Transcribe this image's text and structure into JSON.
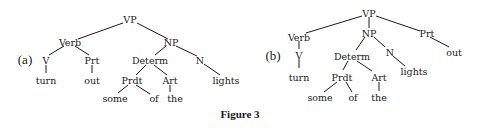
{
  "caption": "Figure 3",
  "trees": {
    "a": {
      "label": "(a)",
      "nodes": {
        "vp": "VP",
        "verb": "Verb",
        "np": "NP",
        "v": "V",
        "prt": "Prt",
        "determ": "Determ",
        "n": "N",
        "turn": "turn",
        "out": "out",
        "prdt": "Prdt",
        "art": "Art",
        "lights": "lights",
        "some": "some",
        "of": "of",
        "the": "the"
      }
    },
    "b": {
      "label": "(b)",
      "nodes": {
        "vp": "VP",
        "verb": "Verb",
        "np": "NP",
        "prt": "Prt",
        "v": "V",
        "determ": "Determ",
        "n": "N",
        "out": "out",
        "turn": "turn",
        "prdt": "Prdt",
        "art": "Art",
        "lights": "lights",
        "some": "some",
        "of": "of",
        "the": "the"
      }
    }
  }
}
